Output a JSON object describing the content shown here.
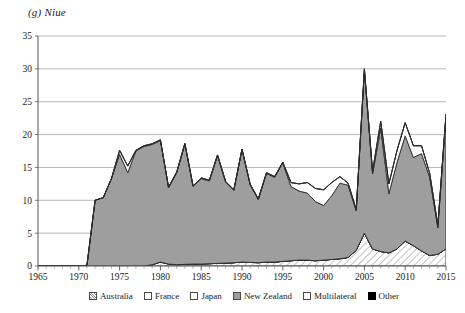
{
  "chart_data": {
    "type": "area",
    "title": "(g) Niue",
    "xlabel": "",
    "ylabel": "",
    "stacked": true,
    "grid": true,
    "legend_position": "bottom",
    "xlim": [
      1965,
      2015
    ],
    "ylim": [
      0,
      35
    ],
    "yticks": [
      0,
      5,
      10,
      15,
      20,
      25,
      30,
      35
    ],
    "xticks": [
      1965,
      1970,
      1975,
      1980,
      1985,
      1990,
      1995,
      2000,
      2005,
      2010,
      2015
    ],
    "x": [
      1965,
      1966,
      1967,
      1968,
      1969,
      1970,
      1971,
      1972,
      1973,
      1974,
      1975,
      1976,
      1977,
      1978,
      1979,
      1980,
      1981,
      1982,
      1983,
      1984,
      1985,
      1986,
      1987,
      1988,
      1989,
      1990,
      1991,
      1992,
      1993,
      1994,
      1995,
      1996,
      1997,
      1998,
      1999,
      2000,
      2001,
      2002,
      2003,
      2004,
      2005,
      2006,
      2007,
      2008,
      2009,
      2010,
      2011,
      2012,
      2013,
      2014,
      2015
    ],
    "series": [
      {
        "name": "Australia",
        "color": "#ffffff",
        "pattern": "diagonal-hatch",
        "values": [
          0,
          0,
          0,
          0,
          0,
          0,
          0,
          0,
          0,
          0,
          0,
          0,
          0,
          0,
          0.2,
          0.6,
          0.3,
          0.2,
          0.25,
          0.3,
          0.3,
          0.35,
          0.4,
          0.45,
          0.5,
          0.6,
          0.55,
          0.5,
          0.6,
          0.6,
          0.7,
          0.8,
          0.9,
          0.9,
          0.8,
          0.9,
          1.0,
          1.1,
          1.3,
          2.4,
          5.0,
          2.6,
          2.2,
          2.0,
          2.6,
          3.8,
          3.1,
          2.3,
          1.6,
          1.8,
          2.6
        ]
      },
      {
        "name": "France",
        "color": "#ffffff",
        "pattern": "light-dots",
        "values": [
          0,
          0,
          0,
          0,
          0,
          0,
          0,
          0,
          0,
          0,
          0,
          0,
          0,
          0,
          0,
          0,
          0,
          0,
          0,
          0,
          0,
          0,
          0,
          0,
          0,
          0,
          0,
          0,
          0,
          0,
          0,
          0,
          0,
          0,
          0,
          0,
          0,
          0,
          0,
          0,
          0,
          0,
          0,
          0,
          0,
          0,
          0,
          0,
          0,
          0,
          0
        ]
      },
      {
        "name": "Japan",
        "color": "#ffffff",
        "pattern": "fine-grid",
        "values": [
          0,
          0,
          0,
          0,
          0,
          0,
          0,
          0,
          0,
          0,
          0,
          0,
          0,
          0,
          0,
          0,
          0,
          0,
          0,
          0,
          0,
          0,
          0,
          0,
          0,
          0,
          0,
          0,
          0,
          0,
          0,
          0,
          0,
          0,
          0,
          0,
          0,
          0,
          0,
          0,
          0,
          0,
          0,
          0,
          0,
          0,
          0,
          0,
          0,
          0,
          0
        ]
      },
      {
        "name": "New Zealand",
        "color": "#9e9e9e",
        "pattern": "solid",
        "values": [
          0,
          0,
          0,
          0,
          0,
          0,
          0.1,
          10.0,
          10.4,
          13.3,
          17.0,
          14.2,
          17.5,
          18.2,
          18.3,
          18.5,
          11.6,
          14.0,
          18.3,
          11.8,
          13.0,
          12.6,
          16.4,
          12.3,
          11.0,
          17.1,
          11.8,
          9.6,
          13.5,
          12.9,
          15.0,
          11.3,
          10.5,
          10.2,
          9.0,
          8.3,
          9.7,
          11.5,
          11.0,
          6.0,
          24.7,
          11.4,
          18.8,
          9.0,
          13.2,
          16.0,
          13.4,
          14.8,
          11.9,
          4.0,
          20.2
        ]
      },
      {
        "name": "Multilateral",
        "color": "#ffffff",
        "pattern": "plain-white",
        "values": [
          0,
          0,
          0,
          0,
          0,
          0,
          0,
          0,
          0,
          0,
          0.6,
          1.0,
          0.1,
          0.1,
          0.1,
          0.1,
          0.1,
          0.1,
          0.1,
          0.1,
          0.1,
          0.1,
          0.1,
          0.1,
          0.1,
          0.1,
          0.1,
          0.1,
          0.1,
          0.1,
          0.1,
          0.6,
          1.1,
          1.6,
          2.0,
          2.4,
          2.0,
          1.0,
          0.3,
          0.2,
          0.3,
          0.4,
          1.0,
          1.5,
          1.8,
          2.0,
          1.8,
          1.2,
          0.6,
          0.4,
          0.3
        ]
      },
      {
        "name": "Other",
        "color": "#000000",
        "pattern": "solid",
        "values": [
          0,
          0,
          0,
          0,
          0,
          0,
          0,
          0,
          0,
          0,
          0,
          0,
          0,
          0,
          0,
          0,
          0,
          0,
          0,
          0,
          0,
          0,
          0,
          0,
          0,
          0,
          0,
          0,
          0,
          0,
          0,
          0,
          0,
          0,
          0,
          0,
          0,
          0,
          0,
          0,
          0,
          0,
          0,
          0,
          0,
          0,
          0,
          0,
          0,
          0,
          0
        ]
      }
    ],
    "legend": [
      {
        "label": "Australia",
        "swatch": "diagonal-hatch"
      },
      {
        "label": "France",
        "swatch": "light-dots"
      },
      {
        "label": "Japan",
        "swatch": "fine-grid"
      },
      {
        "label": "New Zealand",
        "swatch": "solid-gray"
      },
      {
        "label": "Multilateral",
        "swatch": "plain-white"
      },
      {
        "label": "Other",
        "swatch": "solid-black"
      }
    ]
  }
}
